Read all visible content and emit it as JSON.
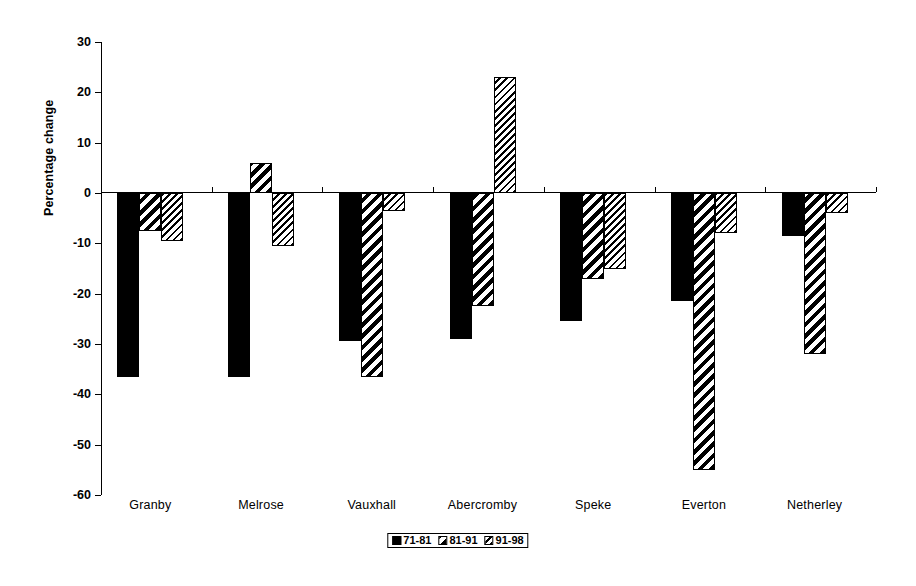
{
  "chart_data": {
    "type": "bar",
    "title": "",
    "subtitle": "",
    "xlabel": "",
    "ylabel": "Percentage change",
    "ylim": [
      -60,
      30
    ],
    "ytick_values": [
      30,
      20,
      10,
      0,
      -10,
      -20,
      -30,
      -40,
      -50,
      -60
    ],
    "ytick_labels": [
      "30",
      "20",
      "10",
      "0",
      "-10",
      "-20",
      "-30",
      "-40",
      "-50",
      "-60"
    ],
    "grid": false,
    "legend_position": "bottom-center",
    "categories": [
      "Granby",
      "Melrose",
      "Vauxhall",
      "Abercromby",
      "Speke",
      "Everton",
      "Netherley"
    ],
    "series": [
      {
        "name": "71-81",
        "pattern": "solid-black",
        "values": [
          -36.5,
          -36.5,
          -29.5,
          -29.0,
          -25.5,
          -21.5,
          -8.5
        ]
      },
      {
        "name": "81-91",
        "pattern": "wide-diagonal-hatch",
        "values": [
          -7.5,
          6.0,
          -36.5,
          -22.5,
          -17.0,
          -55.0,
          -32.0
        ]
      },
      {
        "name": "91-98",
        "pattern": "fine-diagonal-hatch",
        "values": [
          -9.5,
          -10.5,
          -3.5,
          23.0,
          -15.0,
          -8.0,
          -4.0
        ]
      }
    ]
  },
  "legend": {
    "items": [
      {
        "label": "71-81"
      },
      {
        "label": "81-91"
      },
      {
        "label": "91-98"
      }
    ]
  },
  "colors": {
    "axis": "#000000",
    "background": "#ffffff",
    "series_71_81": "#000000",
    "series_81_91": "#000000",
    "series_91_98": "#000000"
  }
}
